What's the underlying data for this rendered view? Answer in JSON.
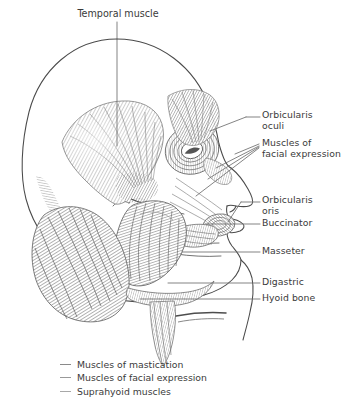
{
  "figure": {
    "kind": "anatomical-illustration",
    "background_color": "#ffffff",
    "line_color": "#4a4a4a",
    "text_color": "#3a3a3a",
    "leader_color": "#6e6e6e",
    "legend_dash_color": "#8a8a8a"
  },
  "title": {
    "text": "Temporal muscle"
  },
  "labels": [
    {
      "id": "orbicularis-oculi",
      "text": "Orbicularis\noculi"
    },
    {
      "id": "muscles-of-facial-expression",
      "text": "Muscles of\nfacial expression"
    },
    {
      "id": "orbicularis-oris",
      "text": "Orbicularis\noris"
    },
    {
      "id": "buccinator",
      "text": "Buccinator"
    },
    {
      "id": "masseter",
      "text": "Masseter"
    },
    {
      "id": "digastric",
      "text": "Digastric"
    },
    {
      "id": "hyoid-bone",
      "text": "Hyoid bone"
    }
  ],
  "legend": {
    "items": [
      {
        "id": "muscles-of-mastication",
        "label": "Muscles of mastication",
        "color": "#8a8a8a"
      },
      {
        "id": "muscles-of-facial-expression",
        "label": "Muscles of facial expression",
        "color": "#999999"
      },
      {
        "id": "suprahyoid-muscles",
        "label": "Suprahyoid muscles",
        "color": "#a8a8a8"
      }
    ]
  }
}
